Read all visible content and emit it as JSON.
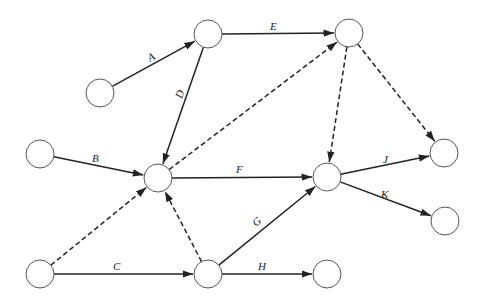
{
  "diagram": {
    "type": "activity-network",
    "colors": {
      "stroke": "#222222",
      "node_stroke": "#555555",
      "background": "#ffffff"
    },
    "nodes": [
      {
        "id": "n1",
        "x": 100,
        "y": 93
      },
      {
        "id": "n2",
        "x": 208,
        "y": 34
      },
      {
        "id": "n3",
        "x": 349,
        "y": 33
      },
      {
        "id": "n4",
        "x": 40,
        "y": 154
      },
      {
        "id": "n5",
        "x": 158,
        "y": 178
      },
      {
        "id": "n6",
        "x": 327,
        "y": 177
      },
      {
        "id": "n7",
        "x": 444,
        "y": 153
      },
      {
        "id": "n8",
        "x": 445,
        "y": 221
      },
      {
        "id": "n9",
        "x": 40,
        "y": 274
      },
      {
        "id": "n10",
        "x": 208,
        "y": 274
      },
      {
        "id": "n11",
        "x": 327,
        "y": 274
      }
    ],
    "edges": [
      {
        "label": "A",
        "from": "n1",
        "to": "n2",
        "dashed": false
      },
      {
        "label": "E",
        "from": "n2",
        "to": "n3",
        "dashed": false
      },
      {
        "label": "D",
        "from": "n2",
        "to": "n5",
        "dashed": false
      },
      {
        "label": "B",
        "from": "n4",
        "to": "n5",
        "dashed": false
      },
      {
        "label": "F",
        "from": "n5",
        "to": "n6",
        "dashed": false
      },
      {
        "label": "C",
        "from": "n9",
        "to": "n10",
        "dashed": false
      },
      {
        "label": "G",
        "from": "n10",
        "to": "n6",
        "dashed": false
      },
      {
        "label": "H",
        "from": "n10",
        "to": "n11",
        "dashed": false
      },
      {
        "label": "J",
        "from": "n6",
        "to": "n7",
        "dashed": false
      },
      {
        "label": "K",
        "from": "n6",
        "to": "n8",
        "dashed": false
      },
      {
        "label": "",
        "from": "n5",
        "to": "n3",
        "dashed": true
      },
      {
        "label": "",
        "from": "n3",
        "to": "n6",
        "dashed": true
      },
      {
        "label": "",
        "from": "n3",
        "to": "n7",
        "dashed": true
      },
      {
        "label": "",
        "from": "n9",
        "to": "n5",
        "dashed": true
      },
      {
        "label": "",
        "from": "n10",
        "to": "n5",
        "dashed": true
      }
    ],
    "labels": {
      "A": "A",
      "B": "B",
      "C": "C",
      "D": "D",
      "E": "E",
      "F": "F",
      "G": "G",
      "H": "H",
      "J": "J",
      "K": "K"
    }
  }
}
